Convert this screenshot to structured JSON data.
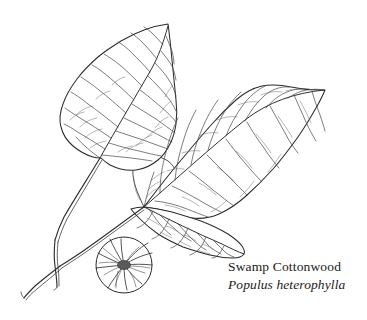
{
  "illustration": {
    "subject": "botanical-line-drawing",
    "caption": {
      "common_name": "Swamp Cottonwood",
      "scientific_name": "Populus heterophylla"
    },
    "ink_color": "#2b2b2b",
    "background_color": "#ffffff",
    "parts": [
      {
        "name": "upper-left-leaf"
      },
      {
        "name": "right-leaf"
      },
      {
        "name": "lower-middle-leaf"
      },
      {
        "name": "hidden-back-leaf"
      },
      {
        "name": "petiole-left"
      },
      {
        "name": "petiole-right"
      },
      {
        "name": "twig"
      },
      {
        "name": "bud-detail-inset"
      }
    ]
  }
}
